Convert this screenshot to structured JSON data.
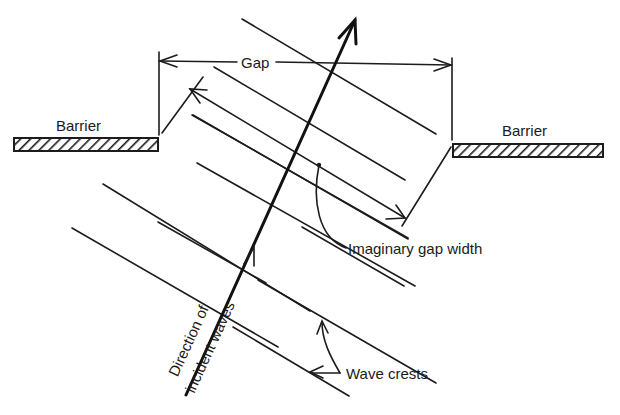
{
  "diagram": {
    "labels": {
      "barrier_left": "Barrier",
      "barrier_right": "Barrier",
      "gap": "Gap",
      "imaginary_gap_width": "Imaginary gap width",
      "direction_line1": "Direction of",
      "direction_line2": "incident waves",
      "wave_crests": "Wave crests"
    },
    "colors": {
      "ink": "#1c1c1c",
      "background": "#ffffff"
    },
    "elements": {
      "barriers": [
        "left barrier (hatched)",
        "right barrier (hatched)"
      ],
      "wave_crest_count": 9,
      "arrows": [
        "direction of incident waves",
        "gap dimension",
        "imaginary gap width"
      ]
    }
  }
}
